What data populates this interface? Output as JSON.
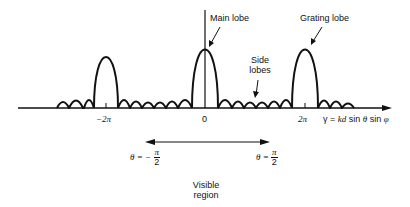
{
  "diagram": {
    "type": "array-factor-pattern",
    "labels": {
      "main_lobe": "Main lobe",
      "grating_lobe": "Grating lobe",
      "side_lobes_line1": "Side",
      "side_lobes_line2": "lobes",
      "visible_region_line1": "Visible",
      "visible_region_line2": "region"
    },
    "axis": {
      "ticks": [
        "−2π",
        "0",
        "2π"
      ],
      "gamma_symbol": "γ",
      "equals": " = ",
      "kd": "kd",
      "sin1": " sin ",
      "theta": "θ",
      "sin2": " sin ",
      "phi": "φ"
    },
    "bounds": {
      "left_prefix": "θ = −",
      "right_prefix": "θ = ",
      "numerator": "π",
      "denominator": "2"
    },
    "colors": {
      "line": "#111111",
      "background": "#ffffff"
    }
  }
}
